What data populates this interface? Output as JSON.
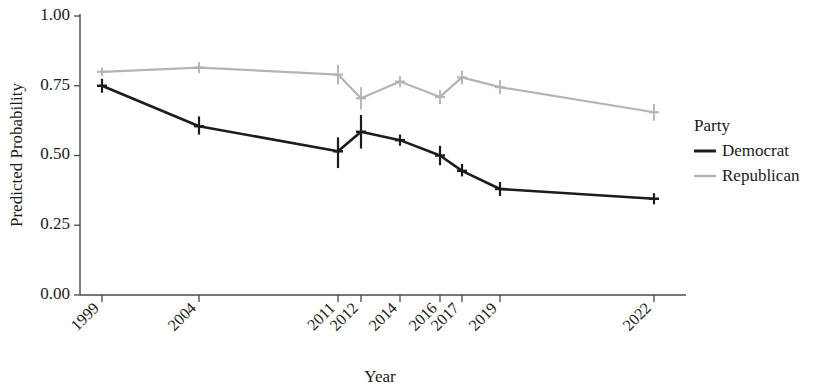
{
  "chart_data": {
    "type": "line",
    "title": "",
    "xlabel": "Year",
    "ylabel": "Predicted Probability",
    "x": [
      1999,
      2004,
      2011,
      2012,
      2014,
      2016,
      2017,
      2019,
      2022
    ],
    "categories": [
      "1999",
      "2004",
      "2011",
      "2012",
      "2014",
      "2016",
      "2017",
      "2019",
      "2022"
    ],
    "xtick_labels": [
      "1999",
      "2004",
      "2011",
      "2012",
      "2014",
      "2016",
      "2017",
      "2019",
      "2022"
    ],
    "ytick_labels": [
      "0.00",
      "0.25",
      "0.50",
      "0.75",
      "1.00"
    ],
    "ytick_values": [
      0.0,
      0.25,
      0.5,
      0.75,
      1.0
    ],
    "ylim": [
      0.0,
      1.0
    ],
    "grid": false,
    "legend_position": "right",
    "legend_title": "Party",
    "series": [
      {
        "name": "Democrat",
        "color": "#1c1c1c",
        "values": [
          0.75,
          0.605,
          0.515,
          0.585,
          0.555,
          0.5,
          0.445,
          0.38,
          0.345
        ],
        "err_low": [
          0.725,
          0.575,
          0.455,
          0.525,
          0.535,
          0.465,
          0.425,
          0.355,
          0.325
        ],
        "err_high": [
          0.775,
          0.64,
          0.565,
          0.645,
          0.575,
          0.535,
          0.47,
          0.405,
          0.365
        ]
      },
      {
        "name": "Republican",
        "color": "#b4b4b4",
        "values": [
          0.8,
          0.815,
          0.79,
          0.705,
          0.765,
          0.71,
          0.78,
          0.745,
          0.655
        ],
        "err_low": [
          0.785,
          0.795,
          0.755,
          0.665,
          0.745,
          0.685,
          0.755,
          0.72,
          0.625
        ],
        "err_high": [
          0.815,
          0.835,
          0.825,
          0.745,
          0.785,
          0.735,
          0.805,
          0.77,
          0.685
        ]
      }
    ]
  },
  "legend": {
    "title": "Party",
    "items": [
      {
        "label": "Democrat",
        "color": "#1c1c1c"
      },
      {
        "label": "Republican",
        "color": "#b4b4b4"
      }
    ]
  },
  "axes": {
    "y_title": "Predicted Probability",
    "x_title": "Year"
  }
}
